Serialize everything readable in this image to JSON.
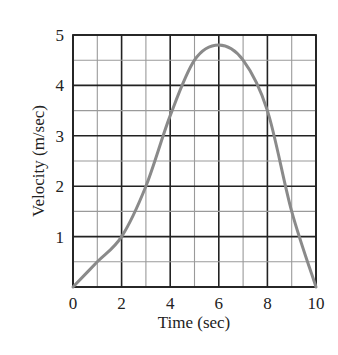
{
  "chart_data": {
    "type": "line",
    "title": "",
    "xlabel": "Time (sec)",
    "ylabel": "Velocity (m/sec)",
    "xlim": [
      0,
      10
    ],
    "ylim": [
      0,
      5
    ],
    "x_ticks": [
      0,
      2,
      4,
      6,
      8,
      10
    ],
    "y_ticks": [
      1,
      2,
      3,
      4,
      5
    ],
    "grid": true,
    "grid_minor_x": 1,
    "grid_minor_y": 0.5,
    "series": [
      {
        "name": "velocity",
        "x": [
          0,
          1,
          2,
          3,
          4,
          5,
          6,
          7,
          8,
          9,
          10
        ],
        "values": [
          0,
          0.5,
          1.0,
          2.0,
          3.4,
          4.5,
          4.8,
          4.5,
          3.5,
          1.5,
          0
        ]
      }
    ]
  },
  "colors": {
    "curve": "#8a8a8a",
    "grid_major": "#222222",
    "grid_minor": "#9a9a9a",
    "text": "#222222"
  }
}
